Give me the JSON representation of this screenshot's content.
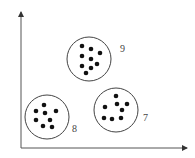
{
  "diagram": {
    "colors": {
      "background": "#ffffff",
      "axis": "#555555",
      "circle": "#444444",
      "dot": "#111111",
      "label": "#444444"
    },
    "axes": {
      "origin": [
        21,
        148
      ],
      "y_top": [
        21,
        12
      ],
      "x_right": [
        187,
        148
      ]
    },
    "clusters": [
      {
        "id": "cluster-9",
        "label": "9",
        "center": [
          89,
          59
        ],
        "radius": 22,
        "label_pos": [
          120,
          52
        ],
        "points": [
          [
            82,
            46
          ],
          [
            91,
            49
          ],
          [
            100,
            53
          ],
          [
            82,
            56
          ],
          [
            91,
            59
          ],
          [
            97,
            64
          ],
          [
            82,
            66
          ],
          [
            91,
            68
          ],
          [
            86,
            73
          ]
        ]
      },
      {
        "id": "cluster-8",
        "label": "8",
        "center": [
          47,
          117
        ],
        "radius": 22,
        "label_pos": [
          72,
          132
        ],
        "points": [
          [
            44,
            105
          ],
          [
            36,
            111
          ],
          [
            56,
            111
          ],
          [
            45,
            113
          ],
          [
            36,
            120
          ],
          [
            50,
            120
          ],
          [
            43,
            126
          ],
          [
            52,
            127
          ]
        ]
      },
      {
        "id": "cluster-7",
        "label": "7",
        "center": [
          116,
          110
        ],
        "radius": 22,
        "label_pos": [
          143,
          121
        ],
        "points": [
          [
            116,
            96
          ],
          [
            117,
            104
          ],
          [
            127,
            104
          ],
          [
            105,
            107
          ],
          [
            122,
            110
          ],
          [
            104,
            118
          ],
          [
            112,
            119
          ],
          [
            121,
            118
          ]
        ]
      }
    ]
  }
}
